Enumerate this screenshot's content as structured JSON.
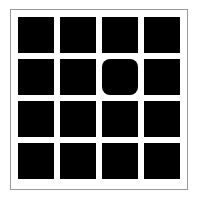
{
  "puzzle": {
    "rows": 4,
    "cols": 4,
    "tile_color": "#000000",
    "background_color": "#ffffff",
    "border_color": "#9a9a9a",
    "odd_tile": {
      "row": 1,
      "col": 2,
      "shape": "rounded-square"
    },
    "tiles": [
      [
        "square",
        "square",
        "square",
        "square"
      ],
      [
        "square",
        "square",
        "rounded-square",
        "square"
      ],
      [
        "square",
        "square",
        "square",
        "square"
      ],
      [
        "square",
        "square",
        "square",
        "square"
      ]
    ]
  }
}
